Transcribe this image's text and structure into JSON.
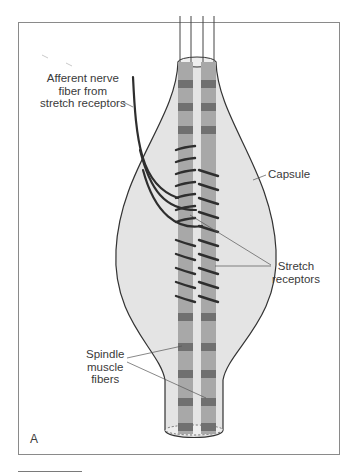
{
  "figure": {
    "panel_letter": "A",
    "labels": {
      "afferent": [
        "Afferent nerve",
        "fiber from",
        "stretch receptors"
      ],
      "capsule": "Capsule",
      "stretch_receptors": [
        "Stretch",
        "receptors"
      ],
      "spindle_fibers": [
        "Spindle",
        "muscle",
        "fibers"
      ]
    },
    "colors": {
      "capsule_fill": "#e4e4e4",
      "capsule_stroke": "#333333",
      "fiber_fill": "#a8a8a8",
      "fiber_band": "#6e6e6e",
      "nerve": "#2e2e2e",
      "leader_line": "#555555",
      "frame_border": "#8a8a8a"
    }
  }
}
